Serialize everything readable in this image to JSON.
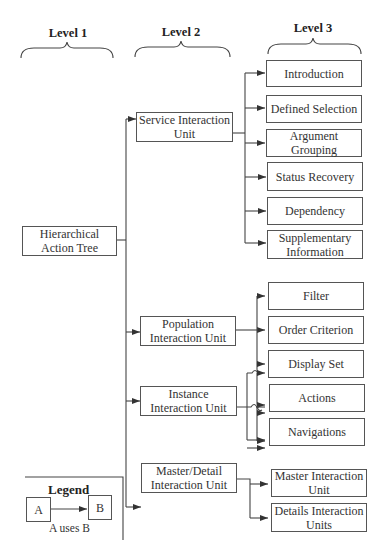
{
  "levels": [
    "Level 1",
    "Level 2",
    "Level 3"
  ],
  "level1": {
    "root": "Hierarchical Action Tree"
  },
  "level2": [
    "Service Interaction Unit",
    "Population Interaction Unit",
    "Instance Interaction Unit",
    "Master/Detail Interaction Unit"
  ],
  "level3": {
    "service": [
      "Introduction",
      "Defined Selection",
      "Argument Grouping",
      "Status Recovery",
      "Dependency",
      "Supplementary Information"
    ],
    "shared": [
      "Filter",
      "Order Criterion",
      "Display Set",
      "Actions",
      "Navigations"
    ],
    "master_detail": [
      "Master Interaction Unit",
      "Details Interaction Units"
    ]
  },
  "edges": [
    {
      "from": "Hierarchical Action Tree",
      "to": [
        "Service Interaction Unit",
        "Population Interaction Unit",
        "Instance Interaction Unit",
        "Master/Detail Interaction Unit"
      ]
    },
    {
      "from": "Service Interaction Unit",
      "to": [
        "Introduction",
        "Defined Selection",
        "Argument Grouping",
        "Status Recovery",
        "Dependency",
        "Supplementary Information"
      ]
    },
    {
      "from": "Population Interaction Unit",
      "to": [
        "Filter",
        "Order Criterion",
        "Display Set",
        "Actions",
        "Navigations"
      ]
    },
    {
      "from": "Instance Interaction Unit",
      "to": [
        "Display Set",
        "Actions",
        "Navigations"
      ]
    },
    {
      "from": "Master/Detail Interaction Unit",
      "to": [
        "Master Interaction Unit",
        "Details Interaction Units"
      ]
    }
  ],
  "legend": {
    "title": "Legend",
    "a": "A",
    "b": "B",
    "caption": "A uses B"
  },
  "colors": {
    "line": "#555555",
    "text": "#333333",
    "background": "#ffffff"
  }
}
